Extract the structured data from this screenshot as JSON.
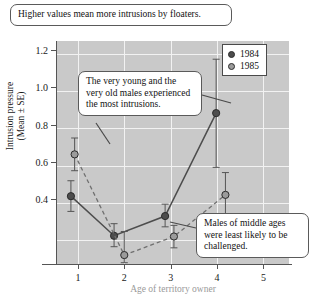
{
  "chart_data": {
    "type": "line",
    "title": "",
    "xlabel": "Age of territory owner",
    "ylabel": "Intrusion pressure (Mean ± SE)",
    "ylabel_line1": "Intrusion pressure",
    "ylabel_line2": "(Mean ± SE)",
    "x": [
      1,
      2,
      3,
      4,
      5
    ],
    "xtick_labels": [
      "1",
      "2",
      "3",
      "4",
      "5"
    ],
    "ytick_labels": [
      "0.4",
      "0.6",
      "0.8",
      "1.0",
      "1.2",
      "1.4"
    ],
    "ytick_values": [
      0.4,
      0.6,
      0.8,
      1.0,
      1.2,
      1.4
    ],
    "xlim": [
      0.55,
      5.55
    ],
    "ylim": [
      0.27,
      1.47
    ],
    "grid": true,
    "legend_position": "top-right",
    "series": [
      {
        "name": "1984",
        "color": "#4d4d4d",
        "linestyle": "solid",
        "marker": "circle-dark",
        "x": [
          0.85,
          1.78,
          2.88,
          3.98
        ],
        "values": [
          0.635,
          0.422,
          0.528,
          1.082
        ],
        "error_low": [
          0.553,
          0.363,
          0.47,
          0.79
        ],
        "error_high": [
          0.718,
          0.487,
          0.592,
          1.372
        ]
      },
      {
        "name": "1985",
        "color": "#8c8c8c",
        "linestyle": "dashed",
        "marker": "circle-light",
        "x": [
          0.93,
          2.0,
          3.07,
          4.18
        ],
        "values": [
          0.86,
          0.318,
          0.418,
          0.642
        ],
        "error_low": [
          0.772,
          0.277,
          0.357,
          0.523
        ],
        "error_high": [
          0.948,
          0.445,
          0.478,
          0.762
        ]
      }
    ],
    "annotations": [
      {
        "id": "top",
        "text": "Higher values mean more intrusions by floaters."
      },
      {
        "id": "middle",
        "text": "The very young and the very old males experienced the most intrusions."
      },
      {
        "id": "bottom",
        "text": "Males of middle ages were least likely to be challenged."
      }
    ]
  },
  "legend": {
    "items": [
      {
        "label": "1984",
        "color": "#4d4d4d"
      },
      {
        "label": "1985",
        "color": "#9a9a9a"
      }
    ]
  },
  "colors": {
    "plot_background": "#c9c9c9",
    "gridline": "#f2f2f2",
    "axis": "#555555",
    "series_1984": "#4d4d4d",
    "series_1985": "#8c8c8c",
    "callout_border": "#5a5a5a",
    "callout_background": "#ffffff"
  }
}
